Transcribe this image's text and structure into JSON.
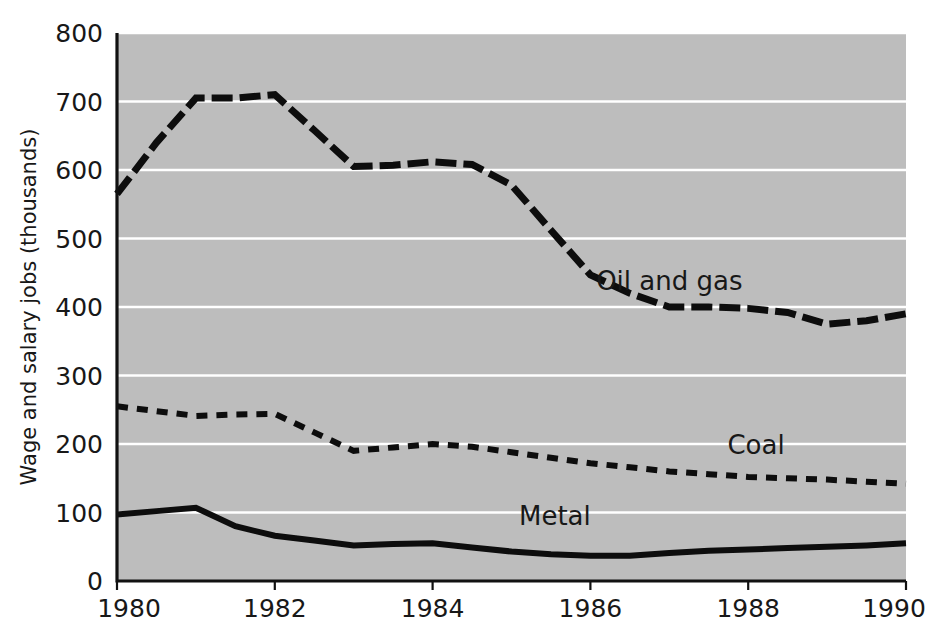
{
  "chart_data": {
    "type": "line",
    "title": "",
    "subtitle": "",
    "xlabel": "",
    "ylabel": "Wage and salary jobs (thousands)",
    "xlim": [
      1980,
      1990
    ],
    "ylim": [
      0,
      800
    ],
    "x_ticks": [
      1980,
      1982,
      1984,
      1986,
      1988,
      1990
    ],
    "x_tick_labels": [
      "1980",
      "1982",
      "1984",
      "1986",
      "1988",
      "1990"
    ],
    "y_ticks": [
      0,
      100,
      200,
      300,
      400,
      500,
      600,
      700,
      800
    ],
    "y_tick_labels": [
      "0",
      "100",
      "200",
      "300",
      "400",
      "500",
      "600",
      "700",
      "800"
    ],
    "grid": "horizontal",
    "grid_color": "#ffffff",
    "plot_background": "#bdbdbd",
    "legend_position": "inline-annotations",
    "x": [
      1980,
      1980.5,
      1981,
      1981.5,
      1982,
      1982.5,
      1983,
      1983.5,
      1984,
      1984.5,
      1985,
      1985.5,
      1986,
      1986.5,
      1987,
      1987.5,
      1988,
      1988.5,
      1989,
      1989.5,
      1990
    ],
    "series": [
      {
        "name": "Oil and gas",
        "label": "Oil and gas",
        "line_style": "long-dash",
        "color": "#0d0d0d",
        "line_width": 7,
        "dash_pattern": "21,7",
        "label_x": 1987.0,
        "label_y": 425,
        "values": [
          565,
          640,
          705,
          705,
          710,
          658,
          605,
          607,
          612,
          608,
          578,
          512,
          447,
          420,
          400,
          400,
          398,
          392,
          375,
          380,
          390
        ]
      },
      {
        "name": "Coal",
        "label": "Coal",
        "line_style": "short-dash",
        "color": "#0d0d0d",
        "line_width": 6,
        "dash_pattern": "11,9",
        "label_x": 1988.1,
        "label_y": 185,
        "values": [
          255,
          248,
          241,
          243,
          244,
          217,
          190,
          195,
          200,
          196,
          188,
          180,
          172,
          166,
          160,
          156,
          152,
          150,
          148,
          145,
          142
        ]
      },
      {
        "name": "Metal",
        "label": "Metal",
        "line_style": "solid",
        "color": "#0d0d0d",
        "line_width": 6,
        "dash_pattern": "",
        "label_x": 1985.55,
        "label_y": 82,
        "values": [
          97,
          102,
          107,
          80,
          66,
          59,
          52,
          54,
          55,
          49,
          43,
          39,
          37,
          37,
          41,
          44,
          46,
          48,
          50,
          52,
          55
        ]
      }
    ]
  },
  "figure": {
    "background": "#ffffff",
    "plot_left": 117,
    "plot_right": 906,
    "plot_top": 33,
    "plot_bottom": 581
  }
}
